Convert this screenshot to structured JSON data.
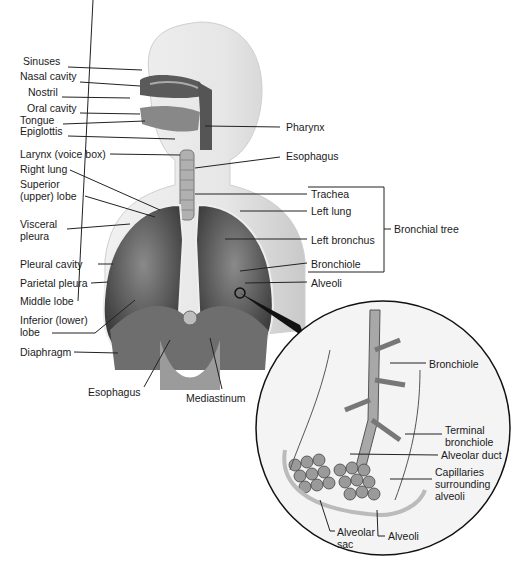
{
  "diagram": {
    "left_labels": [
      {
        "id": "sinuses",
        "text": "Sinuses",
        "x": 23,
        "y": 60
      },
      {
        "id": "nasal-cavity",
        "text": "Nasal cavity",
        "x": 20,
        "y": 76
      },
      {
        "id": "nostril",
        "text": "Nostril",
        "x": 28,
        "y": 91
      },
      {
        "id": "oral-cavity",
        "text": "Oral cavity",
        "x": 27,
        "y": 107
      },
      {
        "id": "tongue",
        "text": "Tongue",
        "x": 20,
        "y": 119
      },
      {
        "id": "epiglottis",
        "text": "Epiglottis",
        "x": 20,
        "y": 130
      },
      {
        "id": "larynx",
        "text": "Larynx (voice box)",
        "x": 20,
        "y": 148
      },
      {
        "id": "right-lung",
        "text": "Right lung",
        "x": 20,
        "y": 164
      },
      {
        "id": "superior-lobe",
        "text": "Superior\n(upper) lobe",
        "x": 20,
        "y": 178
      },
      {
        "id": "visceral-pleura",
        "text": "Visceral\npleura",
        "x": 20,
        "y": 217
      },
      {
        "id": "pleural-cavity",
        "text": "Pleural cavity",
        "x": 20,
        "y": 258
      },
      {
        "id": "parietal-pleura",
        "text": "Parietal pleura",
        "x": 20,
        "y": 276
      },
      {
        "id": "middle-lobe",
        "text": "Middle lobe",
        "x": 20,
        "y": 295
      },
      {
        "id": "inferior-lobe",
        "text": "Inferior (lower)\nlobe",
        "x": 20,
        "y": 312
      },
      {
        "id": "diaphragm",
        "text": "Diaphragm",
        "x": 20,
        "y": 346
      },
      {
        "id": "esophagus-bottom",
        "text": "Esophagus",
        "x": 88,
        "y": 384
      },
      {
        "id": "mediastinum",
        "text": "Mediastinum",
        "x": 186,
        "y": 391
      }
    ],
    "right_labels": [
      {
        "id": "pharynx",
        "text": "Pharynx",
        "x": 286,
        "y": 121
      },
      {
        "id": "esophagus-top",
        "text": "Esophagus",
        "x": 286,
        "y": 151
      },
      {
        "id": "trachea",
        "text": "Trachea",
        "x": 311,
        "y": 189
      },
      {
        "id": "left-lung",
        "text": "Left lung",
        "x": 311,
        "y": 206
      },
      {
        "id": "left-bronchus",
        "text": "Left bronchus",
        "x": 311,
        "y": 234
      },
      {
        "id": "bronchiole",
        "text": "Bronchiole",
        "x": 311,
        "y": 258
      },
      {
        "id": "alveoli",
        "text": "Alveoli",
        "x": 311,
        "y": 276
      }
    ],
    "group_label": {
      "id": "bronchial-tree",
      "text": "Bronchial tree",
      "x": 394,
      "y": 223
    },
    "inset_labels": [
      {
        "id": "inset-bronchiole",
        "text": "Bronchiole",
        "x": 429,
        "y": 358
      },
      {
        "id": "terminal-bronchiole",
        "text": "Terminal\nbronchiole",
        "x": 445,
        "y": 426
      },
      {
        "id": "alveolar-duct",
        "text": "Alveolar duct",
        "x": 441,
        "y": 450
      },
      {
        "id": "capillaries",
        "text": "Capillaries\nsurrounding\nalveoli",
        "x": 435,
        "y": 467
      },
      {
        "id": "alveolar-sac",
        "text": "Alveolar\nsac",
        "x": 337,
        "y": 528
      },
      {
        "id": "inset-alveoli",
        "text": "Alveoli",
        "x": 388,
        "y": 532
      }
    ]
  }
}
